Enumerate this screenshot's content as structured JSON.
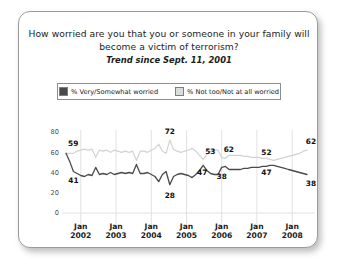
{
  "card": {
    "border_color": "#9a9a9a",
    "background": "#ffffff"
  },
  "title": {
    "line1": "How worried are you that you or someone in your family will",
    "line2": "become a victim of terrorism?",
    "subtitle": "Trend since Sept. 11, 2001"
  },
  "legend": {
    "position": "top",
    "items": [
      {
        "label": "% Very/Somewhat worried",
        "color": "#4a4a4a",
        "swatch": "dark"
      },
      {
        "label": "% Not too/Not at all worried",
        "color": "#dcdcdc",
        "swatch": "light"
      }
    ]
  },
  "chart_data": {
    "type": "line",
    "title": "How worried are you that you or someone in your family will become a victim of terrorism?",
    "subtitle": "Trend since Sept. 11, 2001",
    "xlabel": "",
    "ylabel": "",
    "ylim": [
      0,
      80
    ],
    "yticks": [
      0,
      20,
      40,
      60,
      80
    ],
    "ytick_labels": [
      "0",
      "20",
      "40",
      "60",
      "80"
    ],
    "grid": "vertical-at-year-ticks",
    "xtick_labels": [
      {
        "month": "Jan",
        "year": "2002"
      },
      {
        "month": "Jan",
        "year": "2003"
      },
      {
        "month": "Jan",
        "year": "2004"
      },
      {
        "month": "Jan",
        "year": "2005"
      },
      {
        "month": "Jan",
        "year": "2006"
      },
      {
        "month": "Jan",
        "year": "2007"
      },
      {
        "month": "Jan",
        "year": "2008"
      }
    ],
    "x_range": [
      "Sept 2001",
      "late 2008"
    ],
    "series": [
      {
        "name": "% Very/Somewhat worried",
        "color": "#4a4a4a",
        "values": [
          59,
          51,
          41,
          39,
          37,
          36,
          38,
          37,
          45,
          38,
          39,
          38,
          40,
          38,
          39,
          40,
          39,
          40,
          39,
          48,
          39,
          39,
          40,
          38,
          36,
          31,
          38,
          41,
          28,
          36,
          38,
          39,
          38,
          37,
          35,
          38,
          42,
          47,
          42,
          39,
          38,
          38,
          45,
          46,
          43,
          43,
          43,
          43,
          44,
          44,
          45,
          45,
          45,
          46,
          46,
          47,
          47,
          46,
          45,
          44,
          43,
          42,
          41,
          40,
          39,
          38
        ],
        "labeled_points": [
          {
            "label": "41",
            "value": 41
          },
          {
            "label": "28",
            "value": 28
          },
          {
            "label": "47",
            "value": 47
          },
          {
            "label": "38",
            "value": 38
          },
          {
            "label": "47",
            "value": 47
          },
          {
            "label": "38",
            "value": 38
          }
        ]
      },
      {
        "name": "% Not too/Not at all worried",
        "color": "#d2d2d2",
        "values": [
          59,
          59,
          59,
          61,
          62,
          63,
          62,
          63,
          55,
          62,
          61,
          62,
          60,
          62,
          61,
          60,
          61,
          60,
          61,
          52,
          61,
          61,
          60,
          62,
          64,
          68,
          61,
          59,
          72,
          63,
          61,
          60,
          61,
          62,
          64,
          61,
          57,
          53,
          58,
          61,
          62,
          62,
          55,
          54,
          57,
          57,
          57,
          57,
          56,
          56,
          55,
          55,
          55,
          54,
          54,
          53,
          52,
          53,
          54,
          55,
          56,
          57,
          58,
          59,
          61,
          62
        ],
        "labeled_points": [
          {
            "label": "59",
            "value": 59
          },
          {
            "label": "72",
            "value": 72
          },
          {
            "label": "53",
            "value": 53
          },
          {
            "label": "62",
            "value": 62
          },
          {
            "label": "52",
            "value": 52
          },
          {
            "label": "62",
            "value": 62
          }
        ]
      }
    ],
    "annotations": [
      {
        "text": "59",
        "series": "% Not too/Not at all worried",
        "position": "start-top"
      },
      {
        "text": "41",
        "series": "% Very/Somewhat worried",
        "position": "start-bottom"
      },
      {
        "text": "72",
        "series": "% Not too/Not at all worried",
        "position": "peak"
      },
      {
        "text": "28",
        "series": "% Very/Somewhat worried",
        "position": "trough"
      },
      {
        "text": "53",
        "series": "% Not too/Not at all worried",
        "position": "mid"
      },
      {
        "text": "47",
        "series": "% Very/Somewhat worried",
        "position": "mid"
      },
      {
        "text": "62",
        "series": "% Not too/Not at all worried",
        "position": "mid"
      },
      {
        "text": "38",
        "series": "% Very/Somewhat worried",
        "position": "mid"
      },
      {
        "text": "52",
        "series": "% Not too/Not at all worried",
        "position": "late"
      },
      {
        "text": "47",
        "series": "% Very/Somewhat worried",
        "position": "late"
      },
      {
        "text": "62",
        "series": "% Not too/Not at all worried",
        "position": "end"
      },
      {
        "text": "38",
        "series": "% Very/Somewhat worried",
        "position": "end"
      }
    ]
  }
}
